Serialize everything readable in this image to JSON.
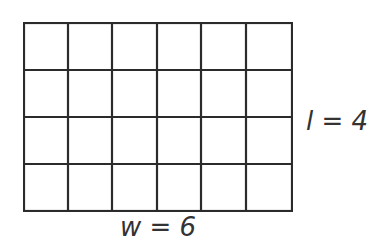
{
  "diagram": {
    "type": "rectangle-grid",
    "columns": 6,
    "rows": 4,
    "line_color": "#2b2b2b",
    "background": "#ffffff",
    "labels": {
      "length": "l = 4",
      "width": "w = 6"
    }
  }
}
